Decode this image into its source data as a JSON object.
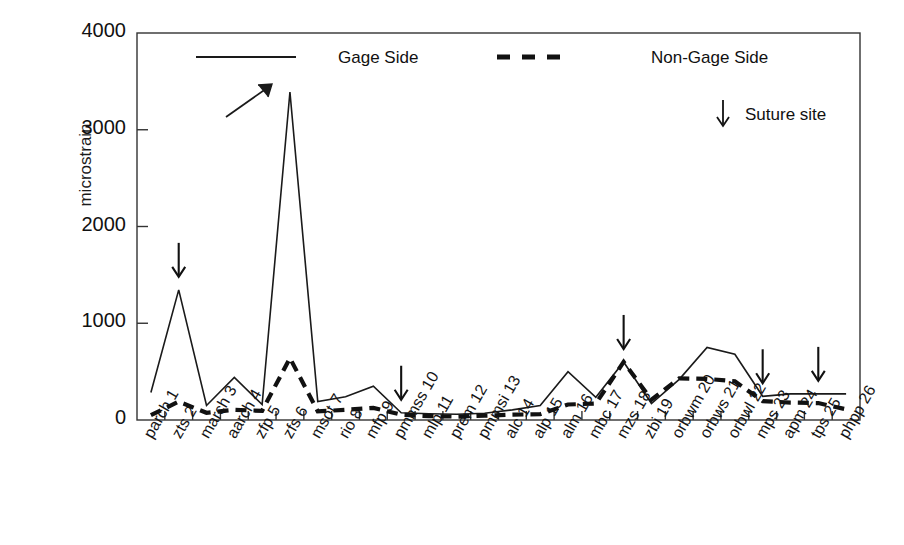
{
  "chart_data": {
    "type": "line",
    "title": "",
    "xlabel": "",
    "ylabel": "microstrain",
    "ylim": [
      0,
      4000
    ],
    "yticks": [
      0,
      1000,
      2000,
      3000,
      4000
    ],
    "grid": false,
    "legend_position": "top",
    "categories": [
      "parch 1",
      "zts 2",
      "march 3",
      "aarch 4",
      "zfp 5",
      "zfs 6",
      "msot 7",
      "rio 8",
      "mfp 9",
      "pmmss 10",
      "mlp 11",
      "prem 12",
      "pmmsi 13",
      "alc 14",
      "alp 15",
      "alm 16",
      "mbc 17",
      "mzs 18",
      "zbi 19",
      "orbwm 20",
      "orbws 21",
      "orbwl 22",
      "mps 23",
      "apm 24",
      "tps 25",
      "phpp 26"
    ],
    "series": [
      {
        "name": "Gage Side",
        "style": "solid",
        "values": [
          285,
          1345,
          150,
          440,
          160,
          3390,
          190,
          240,
          350,
          75,
          65,
          60,
          70,
          105,
          150,
          500,
          235,
          600,
          170,
          420,
          750,
          680,
          245,
          270,
          270,
          270
        ]
      },
      {
        "name": "Non-Gage Side",
        "style": "dashed",
        "values": [
          50,
          190,
          75,
          105,
          95,
          640,
          90,
          105,
          125,
          55,
          40,
          35,
          45,
          55,
          60,
          160,
          170,
          600,
          210,
          430,
          425,
          400,
          195,
          180,
          175,
          110
        ]
      }
    ],
    "annotations": {
      "suture_marker": "↓",
      "suture_label": "Suture site",
      "suture_sites": [
        "zts 2",
        "pmmss 10",
        "mzs 18",
        "mps 23",
        "tps 25"
      ],
      "peak_arrow_category": "zfs 6"
    }
  },
  "legend": {
    "gage_side": "Gage Side",
    "non_gage_side": "Non-Gage Side",
    "suture_site": "Suture site",
    "suture_arrow_glyph": "↓"
  },
  "axis": {
    "y_label": "microstrain",
    "y_ticks": [
      "4000",
      "3000",
      "2000",
      "1000",
      "0"
    ]
  },
  "colors": {
    "line": "#1a1a1a",
    "background": "#ffffff",
    "axis": "#333333",
    "text": "#111111"
  }
}
